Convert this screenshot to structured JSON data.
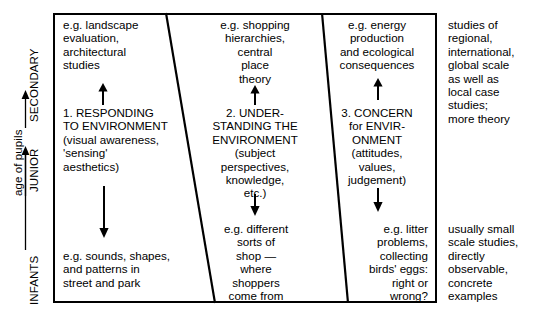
{
  "axis": {
    "caption": "age of pupils",
    "stages": [
      {
        "label": "SECONDARY"
      },
      {
        "label": "JUNIOR"
      },
      {
        "label": "INFANTS"
      }
    ]
  },
  "columns": [
    {
      "id": "responding-to-environment",
      "top_example": "e.g. landscape\nevaluation,\narchitectural\nstudies",
      "heading": "1. RESPONDING\nTO ENVIRONMENT\n(visual awareness,\n'sensing'\naesthetics)",
      "bottom_example": "e.g. sounds, shapes,\nand patterns in\nstreet and park",
      "up_arrow": "arrow-up",
      "down_arrow": "arrow-down"
    },
    {
      "id": "understanding-the-environment",
      "top_example": "e.g. shopping\nhierarchies,\ncentral\nplace\ntheory",
      "heading": "2. UNDER-\nSTANDING THE\nENVIRONMENT\n(subject\nperspectives,\nknowledge,\netc.)",
      "bottom_example": "e.g. different\nsorts of\nshop —\nwhere\nshoppers\ncome from",
      "up_arrow": "arrow-up",
      "down_arrow": "arrow-down"
    },
    {
      "id": "concern-for-environment",
      "top_example": "e.g. energy\nproduction\nand ecological\nconsequences",
      "heading": "3. CONCERN\nfor ENVIR-\nONMENT\n(attitudes,\nvalues,\njudgement)",
      "bottom_example": "e.g. litter\nproblems,\ncollecting\nbirds' eggs:\nright or\nwrong?",
      "up_arrow": "arrow-up",
      "down_arrow": "arrow-down"
    }
  ],
  "side_notes": {
    "top": "studies of\nregional,\ninternational,\nglobal scale\nas well as\nlocal case\nstudies;\nmore theory",
    "bottom": "usually small\nscale studies,\ndirectly\nobservable,\nconcrete\nexamples"
  },
  "colors": {
    "ink": "#000000",
    "paper": "#ffffff"
  }
}
